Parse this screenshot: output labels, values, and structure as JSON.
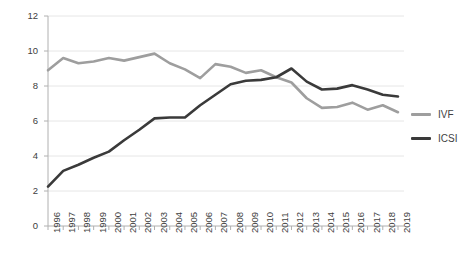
{
  "chart_data": {
    "type": "line",
    "title": "",
    "xlabel": "",
    "ylabel": "",
    "ylim": [
      0,
      12
    ],
    "ytick_step": 2,
    "yticks": [
      "0",
      "2",
      "4",
      "6",
      "8",
      "10",
      "12"
    ],
    "grid": true,
    "legend_position": "right",
    "categories": [
      "1996",
      "1997",
      "1998",
      "1999",
      "2000",
      "2001",
      "2002",
      "2003",
      "2004",
      "2005",
      "2006",
      "2007",
      "2008",
      "2009",
      "2010",
      "2011",
      "2012",
      "2013",
      "2014",
      "2015",
      "2016",
      "2017",
      "2018",
      "2019"
    ],
    "series": [
      {
        "name": "IVF",
        "color": "#9e9e9e",
        "values": [
          8.9,
          9.6,
          9.3,
          9.4,
          9.6,
          9.45,
          9.65,
          9.85,
          9.3,
          8.95,
          8.45,
          9.25,
          9.1,
          8.75,
          8.9,
          8.5,
          8.2,
          7.3,
          6.75,
          6.8,
          7.05,
          6.65,
          6.9,
          6.5
        ]
      },
      {
        "name": "ICSI",
        "color": "#3a3a3a",
        "values": [
          2.25,
          3.15,
          3.5,
          3.9,
          4.25,
          4.9,
          5.5,
          6.15,
          6.2,
          6.2,
          6.9,
          7.5,
          8.1,
          8.3,
          8.35,
          8.5,
          9.0,
          8.25,
          7.8,
          7.85,
          8.05,
          7.8,
          7.5,
          7.4
        ]
      }
    ]
  },
  "legend": {
    "items": [
      {
        "label": "IVF",
        "color": "#9e9e9e"
      },
      {
        "label": "ICSI",
        "color": "#3a3a3a"
      }
    ]
  },
  "colors": {
    "ivf": "#9e9e9e",
    "icsi": "#3a3a3a",
    "grid": "#e6e6e6",
    "axis": "#b0b0b0",
    "text": "#404040",
    "background": "#ffffff"
  }
}
